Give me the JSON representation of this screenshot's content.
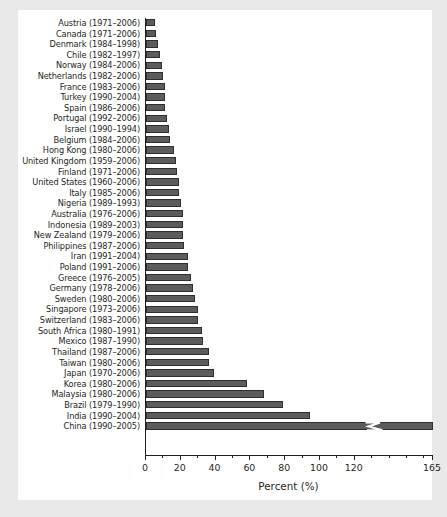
{
  "chart_data": {
    "type": "bar",
    "orientation": "horizontal",
    "title": "",
    "xlabel": "Percent (%)",
    "ylabel": "",
    "xlim": [
      0,
      165
    ],
    "grid": false,
    "legend": null,
    "axis_break": {
      "present": true,
      "after": 125,
      "final_tick": 165,
      "series_clipped": "China (1990–2005)"
    },
    "xticks": [
      0,
      20,
      40,
      60,
      80,
      100,
      120,
      165
    ],
    "xticklabels": [
      "0",
      "20",
      "40",
      "60",
      "80",
      "100",
      "120",
      "165"
    ],
    "minor_xticks": [
      10,
      30,
      50,
      70,
      90,
      110,
      130,
      140,
      150,
      160
    ],
    "bar_color": "#5c5c5c",
    "bar_edge_color": "#2e2e2e",
    "categories": [
      "Austria (1971–2006)",
      "Canada (1971–2006)",
      "Denmark  (1984–1998)",
      "Chile (1982–1997)",
      "Norway (1984–2006)",
      "Netherlands (1982–2006)",
      "France (1983–2006)",
      "Turkey (1990–2004)",
      "Spain (1986–2006)",
      "Portugal (1992–2006)",
      "Israel (1990–1994)",
      "Belgium (1984–2006)",
      "Hong Kong (1980–2006)",
      "United Kingdom (1959–2006)",
      "Finland (1971–2006)",
      "United States (1960–2006)",
      "Italy (1985–2006)",
      "Nigeria (1989–1993)",
      "Australia (1976–2006)",
      "Indonesia (1989–2003)",
      "New Zealand (1979–2006)",
      "Philippines (1987–2006)",
      "Iran (1991–2004)",
      "Poland (1991–2006)",
      "Greece (1976–2005)",
      "Germany (1978–2006)",
      "Sweden (1980–2006)",
      "Singapore (1973–2006)",
      "Switzerland (1983–2006)",
      "South Africa (1980–1991)",
      "Mexico (1987–1990)",
      "Thailand (1987–2006)",
      "Taiwan (1980–2006)",
      "Japan (1970–2006)",
      "Korea (1980–2006)",
      "Malaysia (1980–2006)",
      "Brazil (1979–1990)",
      "India (1990–2004)",
      "China (1990–2005)"
    ],
    "values": [
      5,
      6,
      7,
      8,
      9,
      10,
      11,
      11,
      11,
      12,
      13,
      14,
      16,
      17,
      18,
      19,
      19,
      20,
      21,
      21,
      21,
      22,
      24,
      24,
      26,
      27,
      28,
      30,
      30,
      32,
      33,
      36,
      36,
      39,
      58,
      68,
      79,
      94,
      165
    ]
  },
  "caption": {
    "text": ""
  }
}
